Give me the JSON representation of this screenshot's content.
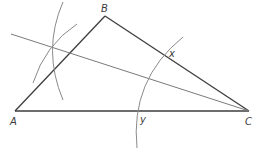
{
  "figure": {
    "type": "geometric-construction",
    "colors": {
      "background": "#ffffff",
      "triangle": "#3d3d3d",
      "construction": "#8a8a8a",
      "bisector": "#7a7a7a",
      "labels": "#3a3a3a"
    },
    "vertices": {
      "A": {
        "label": "A",
        "x": 15,
        "y": 111
      },
      "B": {
        "label": "B",
        "x": 105,
        "y": 16
      },
      "C": {
        "label": "C",
        "x": 249,
        "y": 111
      }
    },
    "points": {
      "x": {
        "label": "x",
        "x": 166,
        "y": 54
      },
      "y": {
        "label": "y",
        "x": 140,
        "y": 111
      }
    },
    "labels": {
      "A": "A",
      "B": "B",
      "C": "C",
      "x": "x",
      "y": "y"
    }
  }
}
